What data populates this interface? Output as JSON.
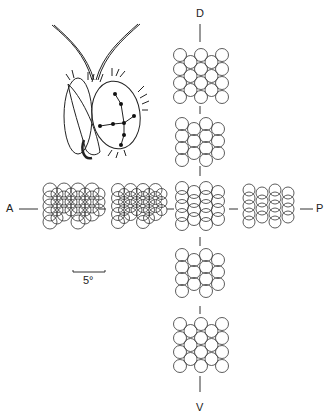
{
  "figure": {
    "axis_labels": {
      "dorsal": "D",
      "ventral": "V",
      "anterior": "A",
      "posterior": "P"
    },
    "scale_bar": {
      "label": "5°"
    },
    "head_drawing": {
      "description": "insect head with compound eye and sampling-point grid",
      "eye_points": 8
    },
    "clusters": [
      {
        "position": "dorsal",
        "pattern": "hexagonal",
        "rows": 4,
        "cols": 4
      },
      {
        "position": "dorsal-mid",
        "pattern": "columns-offset",
        "rows": 4,
        "cols": 4
      },
      {
        "position": "center",
        "pattern": "columns-vertically-compressed",
        "rows": 5,
        "cols": 4
      },
      {
        "position": "ventral-mid",
        "pattern": "columns-offset",
        "rows": 4,
        "cols": 4
      },
      {
        "position": "ventral",
        "pattern": "hexagonal",
        "rows": 4,
        "cols": 4
      },
      {
        "position": "anterior-far",
        "pattern": "overlapping-dense",
        "rows": 5,
        "cols": 4
      },
      {
        "position": "anterior-mid",
        "pattern": "overlapping",
        "rows": 5,
        "cols": 4
      },
      {
        "position": "posterior",
        "pattern": "columns-compressed",
        "rows": 5,
        "cols": 4
      }
    ]
  }
}
